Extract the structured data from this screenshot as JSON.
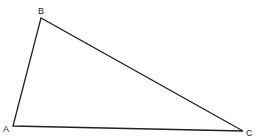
{
  "diagram": {
    "type": "triangle",
    "vertices": [
      {
        "label": "A",
        "x": 13,
        "y": 126,
        "lx": 3,
        "ly": 132
      },
      {
        "label": "B",
        "x": 41,
        "y": 18,
        "lx": 38,
        "ly": 14
      },
      {
        "label": "C",
        "x": 243,
        "y": 131,
        "lx": 246,
        "ly": 136
      }
    ],
    "stroke": "#222222"
  }
}
